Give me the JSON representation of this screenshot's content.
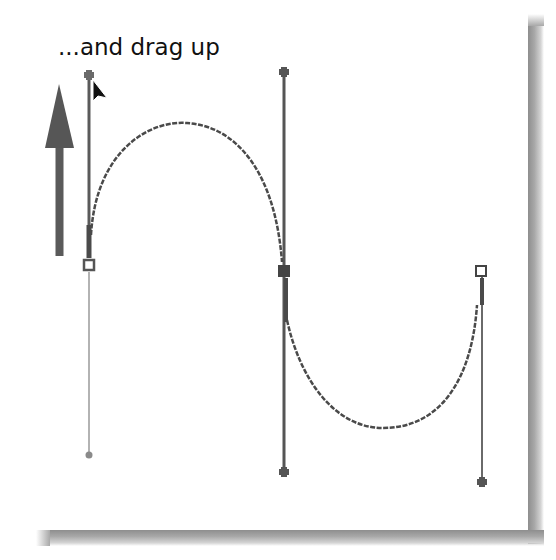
{
  "caption": "...and drag up",
  "colors": {
    "background": "#ffffff",
    "ink": "#111111",
    "handle_line": "#555555",
    "handle_line_light": "#8a8a8a",
    "curve": "#4a4a4a",
    "arrow": "#555555",
    "anchor_fill_selected": "#444444",
    "shadow": "#9a9a9a"
  },
  "diagram": {
    "type": "bezier-path-illustration",
    "direction_arrow": {
      "direction": "up",
      "tip": [
        59,
        85
      ],
      "tail": [
        59,
        255
      ]
    },
    "cursor": {
      "type": "arrow-pointer",
      "tip": [
        93,
        80
      ]
    },
    "anchors": [
      {
        "id": "left-anchor",
        "x": 89,
        "y": 265,
        "style": "hollow-square",
        "handle_out": [
          89,
          75
        ],
        "handle_in": [
          89,
          455
        ]
      },
      {
        "id": "middle-anchor",
        "x": 284,
        "y": 271,
        "style": "filled-square",
        "handle_in": [
          284,
          72
        ],
        "handle_out": [
          284,
          471
        ]
      },
      {
        "id": "right-anchor",
        "x": 481,
        "y": 271,
        "style": "hollow-square",
        "handle_in": [
          481,
          481
        ]
      }
    ],
    "curve_segments": [
      {
        "from": "left-anchor",
        "to": "middle-anchor",
        "shape": "arch",
        "peak": [
          187,
          123
        ]
      },
      {
        "from": "middle-anchor",
        "to": "right-anchor",
        "shape": "valley",
        "trough": [
          383,
          428
        ]
      }
    ]
  }
}
